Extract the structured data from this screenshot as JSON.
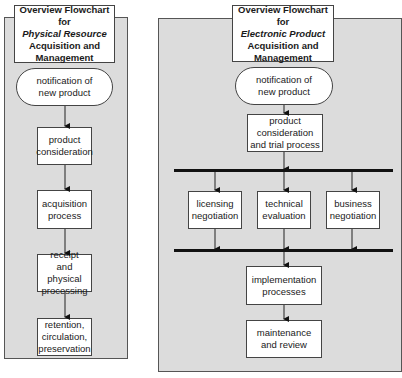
{
  "left": {
    "title": {
      "line1": "Overview Flowchart for",
      "line2": "Physical Resource",
      "line3": "Acquisition and",
      "line4": "Management"
    },
    "steps": [
      {
        "label": "notification of new product",
        "shape": "oval"
      },
      {
        "label": "product consideration",
        "shape": "box"
      },
      {
        "label": "acquisition process",
        "shape": "box"
      },
      {
        "label": "receipt and physical processing",
        "shape": "box"
      },
      {
        "label": "retention, circulation, preservation",
        "shape": "box"
      }
    ]
  },
  "right": {
    "title": {
      "line1": "Overview Flowchart for",
      "line2": "Electronic Product",
      "line3": "Acquisition and",
      "line4": "Management"
    },
    "steps": [
      {
        "label": "notification of new product",
        "shape": "oval"
      },
      {
        "label": "product consideration and trial process",
        "shape": "box"
      }
    ],
    "parallel": [
      {
        "label": "licensing negotiation"
      },
      {
        "label": "technical evaluation"
      },
      {
        "label": "business negotiation"
      }
    ],
    "after": [
      {
        "label": "implementation processes"
      },
      {
        "label": "maintenance and review"
      }
    ]
  },
  "colors": {
    "panel": "#dcdcdc",
    "box": "#ffffff",
    "line": "#111111"
  }
}
